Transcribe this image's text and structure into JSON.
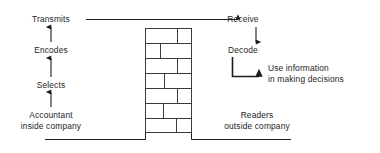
{
  "diagram": {
    "colors": {
      "line": "#1d1d1d",
      "brick_line": "#3a3a3a",
      "background": "#ffffff",
      "text": "#1d1d1d"
    },
    "left_chain": {
      "heading": "Accountant inside company",
      "steps": [
        {
          "label": "Accountant\ninside company",
          "line1": "Accountant",
          "line2": "inside company"
        },
        {
          "label": "Selects"
        },
        {
          "label": "Encodes"
        },
        {
          "label": "Transmits"
        }
      ]
    },
    "right_chain": {
      "heading": "Readers outside company",
      "steps": [
        {
          "label": "Receive"
        },
        {
          "label": "Decode"
        },
        {
          "label": "Use information\nin making decisions",
          "line1": "Use information",
          "line2": "in making decisions"
        }
      ],
      "audience": {
        "line1": "Readers",
        "line2": "outside company"
      }
    },
    "labels": {
      "transmits": "Transmits",
      "encodes": "Encodes",
      "selects": "Selects",
      "accountant_line1": "Accountant",
      "accountant_line2": "inside company",
      "receive": "Receive",
      "decode": "Decode",
      "use_info_line1": "Use information",
      "use_info_line2": "in making decisions",
      "readers_line1": "Readers",
      "readers_line2": "outside company"
    },
    "barrier": {
      "name": "brick-wall",
      "courses": 7,
      "description": "brick wall separating inside and outside of company"
    }
  }
}
